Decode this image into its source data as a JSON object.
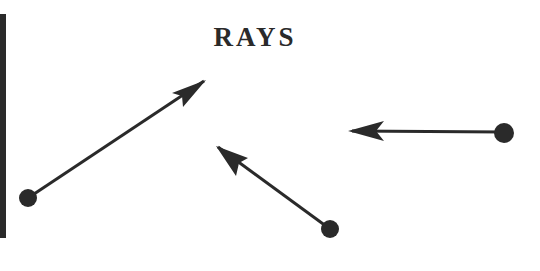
{
  "title": "RAYS",
  "colors": {
    "ink": "#2a2a2a",
    "background": "#ffffff"
  },
  "rays": [
    {
      "name": "ray-1",
      "endpoint": [
        28,
        198
      ],
      "direction_tip": [
        206,
        80
      ]
    },
    {
      "name": "ray-2",
      "endpoint": [
        330,
        229
      ],
      "direction_tip": [
        216,
        146
      ]
    },
    {
      "name": "ray-3",
      "endpoint": [
        504,
        133
      ],
      "direction_tip": [
        348,
        131
      ]
    }
  ]
}
